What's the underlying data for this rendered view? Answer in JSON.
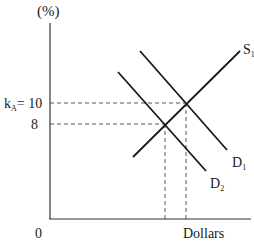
{
  "diagram": {
    "y_axis_label": "(%)",
    "x_axis_label": "Dollars",
    "origin_label": "0",
    "y_ticks": [
      {
        "label_main": "k",
        "label_sub": "A",
        "label_rest": "= 10",
        "value": 10
      },
      {
        "label_main": "8",
        "value": 8
      }
    ],
    "curves": [
      {
        "name": "S",
        "sub": "1",
        "type": "supply"
      },
      {
        "name": "D",
        "sub": "1",
        "type": "demand"
      },
      {
        "name": "D",
        "sub": "2",
        "type": "demand"
      }
    ],
    "colors": {
      "line": "#1a1a1a",
      "dashed": "#555555",
      "background": "#ffffff"
    }
  }
}
